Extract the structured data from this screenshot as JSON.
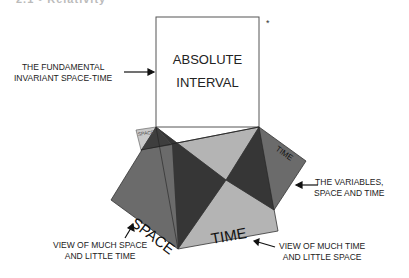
{
  "heading": {
    "text": "2.1 • Relativity"
  },
  "box": {
    "line1": "ABSOLUTE",
    "line2": "INTERVAL",
    "marker": "*"
  },
  "labels": {
    "invariant": {
      "line1": "THE FUNDAMENTAL",
      "line2": "INVARIANT SPACE-TIME"
    },
    "variables": {
      "line1": "THE VARIABLES,",
      "line2": "SPACE AND TIME"
    },
    "much_space": {
      "line1": "VIEW OF MUCH SPACE",
      "line2": "AND LITTLE TIME"
    },
    "much_time": {
      "line1": "VIEW OF MUCH TIME",
      "line2": "AND LITTLE SPACE"
    }
  },
  "shapes": {
    "space_big": "SPACE",
    "time_big": "TIME",
    "space_small": "SPACE",
    "time_small": "TIME"
  },
  "colors": {
    "dark": "#363636",
    "medium": "#6b6b6b",
    "light": "#b4b4b4",
    "lighter": "#c9c9c9",
    "stroke": "#222222"
  }
}
